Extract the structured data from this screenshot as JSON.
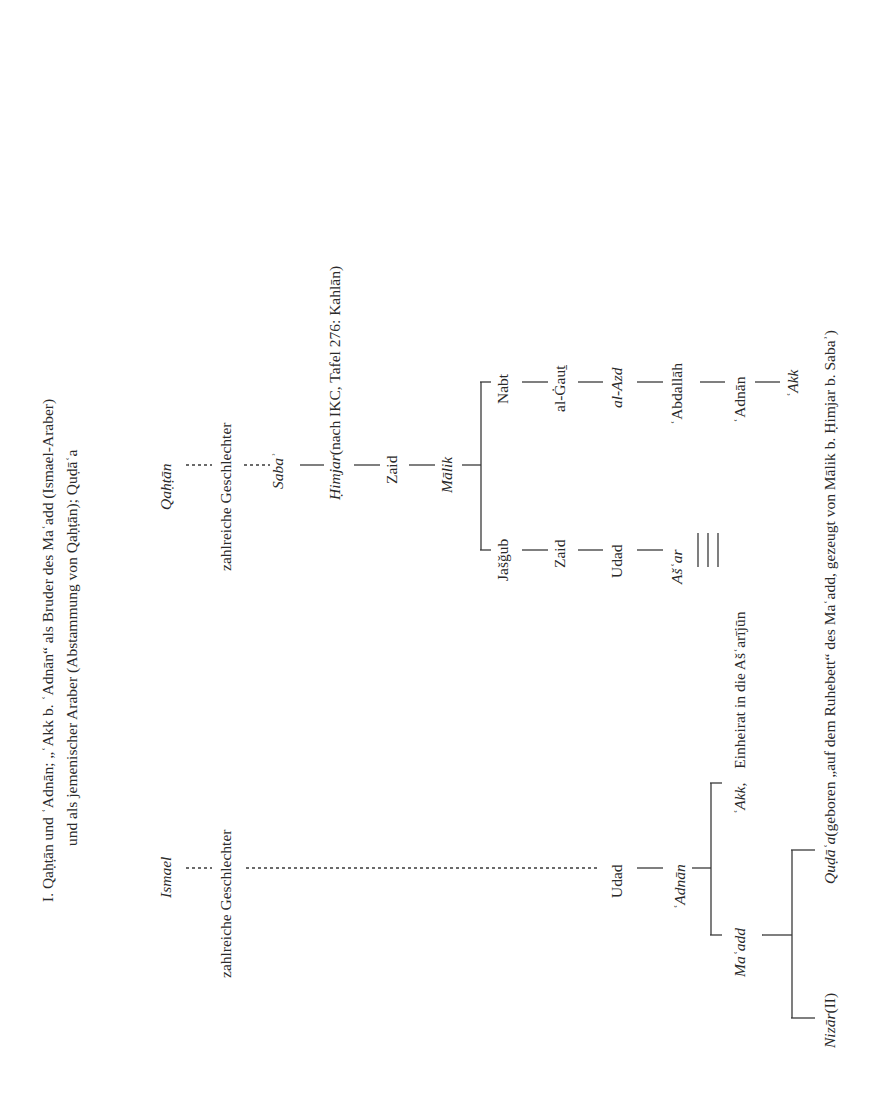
{
  "title": {
    "line1": "I. Qaḥṭān und ʿAdnān; „ʿAkk b. ʿAdnān“ als Bruder des Maʿadd (Ismael-Araber)",
    "line2": "und als jemenischer Araber (Abstammung von Qaḥṭān); Quḍāʿa"
  },
  "qahtan_branch": {
    "root": "Qaḥṭān",
    "generations": "zahlreiche Geschlechter",
    "saba": "Sabaʾ",
    "himjar": "Ḥimjar",
    "himjar_note": "(nach IKC, Tafel 276: Kahlān)",
    "zaid": "Zaid",
    "malik": "Mālik",
    "nabt_line": [
      "Nabt",
      "al-Ġauṯ",
      "al-Azd",
      "ʿAbdallāh",
      "ʿAdnān",
      "ʿAkk"
    ],
    "jasgub_line": [
      "Jašǧub",
      "Zaid",
      "Udad",
      "Ašʿar"
    ]
  },
  "ismael_branch": {
    "root": "Ismael",
    "generations": "zahlreiche Geschlechter",
    "udad": "Udad",
    "adnan": "ʿAdnān",
    "akk": "ʿAkk,",
    "akk_note": "Einheirat in die Ašʿarījūn",
    "maadd": "Maʿadd",
    "nizar": "Nizār",
    "nizar_ref": "(II)",
    "qudaa": "Quḍāʿa",
    "qudaa_note": "(geboren „auf dem Ruhebett“ des Maʿadd, gezeugt von Mālik b. Ḥimjar b. Sabaʾ)"
  }
}
